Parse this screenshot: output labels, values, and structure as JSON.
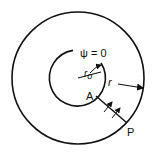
{
  "diagram": {
    "labels": {
      "psi": "ψ = 0",
      "r0": "r",
      "r0_sub": "o",
      "r": "r",
      "A": "A",
      "P": "P"
    },
    "colors": {
      "stroke": "#111111",
      "background": "#ffffff"
    }
  }
}
